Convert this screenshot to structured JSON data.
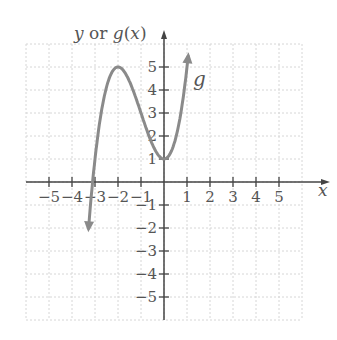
{
  "chart_data": {
    "type": "line",
    "title": "",
    "xlabel": "x",
    "ylabel": "y or g(x)",
    "xlim": [
      -6,
      6
    ],
    "ylim": [
      -6,
      6
    ],
    "x_ticks": [
      -5,
      -4,
      -3,
      -2,
      -1,
      1,
      2,
      3,
      4,
      5
    ],
    "y_ticks": [
      5,
      4,
      3,
      2,
      1,
      -1,
      -2,
      -3,
      -4,
      -5
    ],
    "grid": true,
    "series": [
      {
        "name": "g",
        "label": "g",
        "color": "#8a8a8a",
        "x": [
          -3.3,
          -3.0,
          -2.8,
          -2.5,
          -2.0,
          -1.5,
          -1.0,
          -0.5,
          0.0,
          0.5,
          1.0
        ],
        "y": [
          -5.8,
          -2.0,
          0.0,
          2.0,
          3.0,
          2.6,
          1.8,
          1.15,
          1.0,
          2.4,
          5.7
        ],
        "features": {
          "local_max": [
            -2,
            3
          ],
          "local_min": [
            0,
            1
          ],
          "ends": "arrows"
        }
      }
    ]
  },
  "labels": {
    "y_axis": "y or g(x)",
    "x_axis": "x",
    "curve": "g"
  }
}
